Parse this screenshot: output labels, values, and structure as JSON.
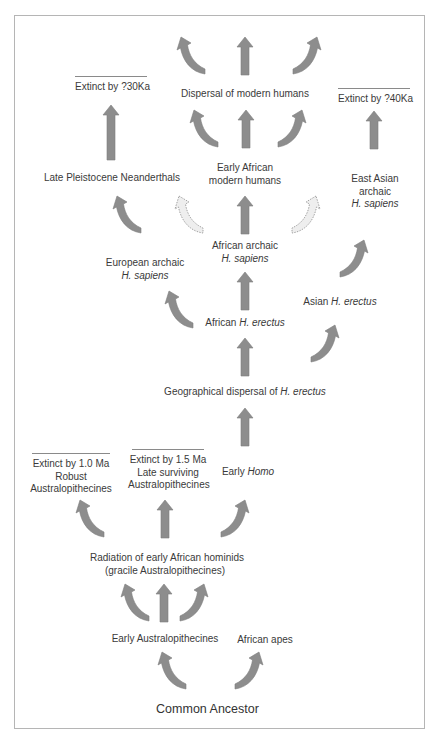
{
  "diagram": {
    "type": "evolutionary-flow-diagram",
    "colors": {
      "arrow": "#8d8d8d",
      "dashed_arrow_fill": "#eeeeee",
      "border": "#b5b5b5",
      "text": "#3a3a3a"
    },
    "nodes": {
      "common_ancestor": "Common Ancestor",
      "early_australopithecines": "Early Australopithecines",
      "african_apes": "African apes",
      "radiation_line1": "Radiation of early African hominids",
      "radiation_line2": "(gracile Australopithecines)",
      "robust_extinct": "Extinct by 1.0 Ma",
      "robust_line1": "Robust",
      "robust_line2": "Australopithecines",
      "late_extinct": "Extinct by 1.5 Ma",
      "late_line1": "Late surviving",
      "late_line2": "Australopithecines",
      "early_homo_prefix": "Early ",
      "early_homo_italic": "Homo",
      "geo_prefix": "Geographical dispersal of ",
      "geo_italic": "H. erectus",
      "african_erectus_prefix": "African ",
      "african_erectus_italic": "H. erectus",
      "asian_erectus_prefix": "Asian ",
      "asian_erectus_italic": "H. erectus",
      "european_line1": "European archaic",
      "european_italic": "H. sapiens",
      "african_archaic_line1": "African archaic",
      "african_archaic_italic": "H. sapiens",
      "neanderthals": "Late Pleistocene Neanderthals",
      "early_modern_line1": "Early African",
      "early_modern_line2": "modern humans",
      "east_asian_line1": "East Asian",
      "east_asian_line2": "archaic",
      "east_asian_italic": "H. sapiens",
      "neanderthal_extinct": "Extinct by ?30Ka",
      "east_asian_extinct": "Extinct by ?40Ka",
      "dispersal_modern": "Dispersal of modern humans"
    }
  }
}
